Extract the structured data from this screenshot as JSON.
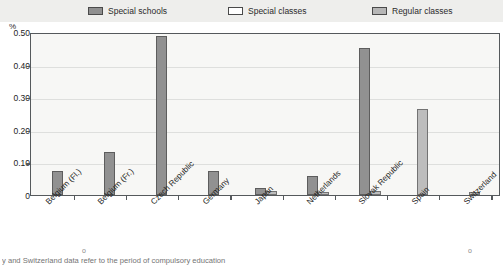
{
  "legend": {
    "items": [
      {
        "label": "Special schools",
        "key": "special_schools",
        "swatch": "dark",
        "color": "#919191"
      },
      {
        "label": "Special classes",
        "key": "special_classes",
        "swatch": "white",
        "color": "#fdfdfd"
      },
      {
        "label": "Regular classes",
        "key": "regular_classes",
        "swatch": "mid",
        "color": "#bdbdbd"
      }
    ]
  },
  "axis": {
    "unit": "%",
    "y_ticks": [
      "0.50",
      "0.40",
      "0.30",
      "0.20",
      "0.10",
      "0"
    ]
  },
  "footnote": {
    "text": "y and Switzerland data refer to the period of compulsory education"
  },
  "chart_data": {
    "type": "bar",
    "title": "",
    "xlabel": "",
    "ylabel": "%",
    "ylim": [
      0,
      0.5
    ],
    "ytick_values": [
      0,
      0.1,
      0.2,
      0.3,
      0.4,
      0.5
    ],
    "grid": true,
    "legend_position": "top",
    "categories": [
      "Belgium (Fl.)",
      "Belgium (Fr.)",
      "Czech Republic",
      "Germany",
      "Japan",
      "Netherlands",
      "Slovak Republic",
      "Spain",
      "Switzerland"
    ],
    "series": [
      {
        "name": "Special schools",
        "key": "special_schools",
        "color": "#919191",
        "values": [
          0.073,
          0.131,
          0.487,
          0.073,
          0.022,
          0.057,
          0.452,
          0,
          0
        ]
      },
      {
        "name": "Special classes",
        "key": "special_classes",
        "color": "#fdfdfd",
        "values": [
          0,
          0,
          0,
          0,
          0,
          0,
          0,
          0,
          0
        ]
      },
      {
        "name": "Regular classes",
        "key": "regular_classes",
        "color": "#bdbdbd",
        "values": [
          0,
          0,
          0,
          0,
          0.012,
          0.008,
          0.012,
          0.265,
          0.009
        ]
      }
    ]
  }
}
